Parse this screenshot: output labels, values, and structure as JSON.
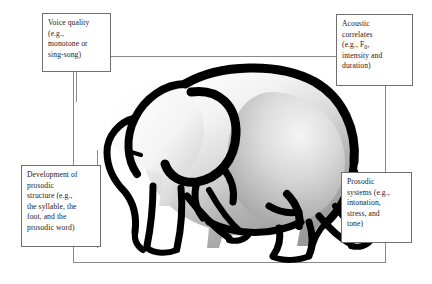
{
  "figure": {
    "type": "diagram",
    "background_color": "#ffffff",
    "frame_color": "#8a8a8a",
    "callout_border_color": "#6f6f6f",
    "text_color": "#1a1a1a",
    "elephant_outline_color": "#000000",
    "elephant_fill_light": "#ffffff",
    "elephant_fill_shadow": "#8f8f8f"
  },
  "callouts": {
    "voice_quality": {
      "id": "voice-quality",
      "lines": [
        "Voice quality",
        "(e.g.,",
        "monotone or",
        "sing-song)"
      ]
    },
    "acoustic_correlates": {
      "id": "acoustic-correlates",
      "lines": [
        "Acoustic",
        "correlates",
        "(e.g., F",
        "intensity and",
        "duration)"
      ],
      "subscript": "0"
    },
    "prosodic_development": {
      "id": "development-of-prosodic-structure",
      "lines": [
        "Development of",
        "prosodic",
        "structure (e.g.,",
        "the syllable, the",
        "foot, and the",
        "prosodic word)"
      ]
    },
    "prosodic_systems": {
      "id": "prosodic-systems",
      "lines": [
        "Prosodic",
        "systems (e.g.,",
        "intonation,",
        "stress, and",
        "tone)"
      ]
    }
  }
}
